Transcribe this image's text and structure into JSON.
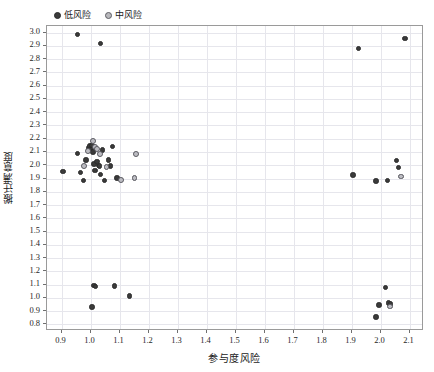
{
  "chart_data": {
    "type": "scatter",
    "title": "",
    "xlabel": "参与度风险",
    "ylabel": "搬迁满意度",
    "xlim": [
      0.85,
      2.15
    ],
    "ylim": [
      0.75,
      3.05
    ],
    "xticks": [
      0.9,
      1.0,
      1.1,
      1.2,
      1.3,
      1.4,
      1.5,
      1.6,
      1.7,
      1.8,
      1.9,
      2.0,
      2.1
    ],
    "xticklabels": [
      "0.9",
      "1.0",
      "1.1",
      "1.2",
      "1.3",
      "1.4",
      "1.5",
      "1.6",
      "1.7",
      "1.8",
      "1.9",
      "2.0",
      "2.1"
    ],
    "yticks": [
      0.8,
      0.9,
      1.0,
      1.1,
      1.2,
      1.3,
      1.4,
      1.5,
      1.6,
      1.7,
      1.8,
      1.9,
      2.0,
      2.1,
      2.2,
      2.3,
      2.4,
      2.5,
      2.6,
      2.7,
      2.8,
      2.9,
      3.0
    ],
    "yticklabels": [
      "0.8",
      "0.9",
      "1.0",
      "1.1",
      "1.2",
      "1.3",
      "1.4",
      "1.5",
      "1.6",
      "1.7",
      "1.8",
      "1.9",
      "2.0",
      "2.1",
      "2.2",
      "2.3",
      "2.4",
      "2.5",
      "2.6",
      "2.7",
      "2.8",
      "2.9",
      "3.0"
    ],
    "grid": true,
    "legend_position": "top-left",
    "colors": {
      "low_risk": "#3a3a3a",
      "mid_risk_fill": "#bcbcc2",
      "mid_risk_edge": "#55555c",
      "gridline": "#e6e6ec",
      "frame": "#9a9a9a"
    },
    "series": [
      {
        "name": "低风险",
        "marker": "filled-circle",
        "points": [
          [
            0.955,
            2.985
          ],
          [
            1.035,
            2.92
          ],
          [
            1.925,
            2.88
          ],
          [
            2.085,
            2.955
          ],
          [
            0.905,
            1.955
          ],
          [
            0.955,
            2.09
          ],
          [
            0.965,
            1.945
          ],
          [
            0.975,
            1.885
          ],
          [
            0.985,
            2.04
          ],
          [
            0.995,
            2.13
          ],
          [
            0.998,
            2.145
          ],
          [
            1.002,
            2.12
          ],
          [
            1.005,
            2.15
          ],
          [
            1.008,
            2.1
          ],
          [
            1.012,
            2.01
          ],
          [
            1.015,
            1.96
          ],
          [
            1.018,
            2.125
          ],
          [
            1.022,
            2.03
          ],
          [
            1.028,
            2.0
          ],
          [
            1.032,
            1.995
          ],
          [
            1.035,
            1.93
          ],
          [
            1.042,
            2.115
          ],
          [
            1.048,
            1.885
          ],
          [
            1.062,
            2.04
          ],
          [
            1.068,
            1.995
          ],
          [
            1.075,
            2.14
          ],
          [
            1.092,
            1.905
          ],
          [
            1.012,
            1.095
          ],
          [
            1.018,
            1.085
          ],
          [
            1.005,
            0.93
          ],
          [
            1.082,
            1.09
          ],
          [
            1.135,
            1.015
          ],
          [
            1.905,
            1.925
          ],
          [
            1.985,
            1.88
          ],
          [
            2.025,
            1.885
          ],
          [
            2.055,
            2.035
          ],
          [
            2.062,
            1.985
          ],
          [
            2.018,
            1.08
          ],
          [
            1.995,
            0.945
          ],
          [
            2.028,
            0.96
          ],
          [
            2.035,
            0.955
          ],
          [
            1.985,
            0.855
          ]
        ]
      },
      {
        "name": "中风险",
        "marker": "open-circle",
        "points": [
          [
            1.008,
            2.185
          ],
          [
            0.992,
            2.11
          ],
          [
            1.015,
            2.135
          ],
          [
            1.022,
            2.125
          ],
          [
            0.978,
            1.995
          ],
          [
            1.032,
            2.085
          ],
          [
            1.055,
            1.985
          ],
          [
            1.105,
            1.89
          ],
          [
            1.158,
            2.085
          ],
          [
            1.152,
            1.905
          ],
          [
            2.072,
            1.915
          ],
          [
            2.032,
            0.935
          ]
        ]
      }
    ]
  },
  "legend": {
    "entries": [
      {
        "label": "低风险",
        "style": "low"
      },
      {
        "label": "中风险",
        "style": "mid"
      }
    ]
  }
}
